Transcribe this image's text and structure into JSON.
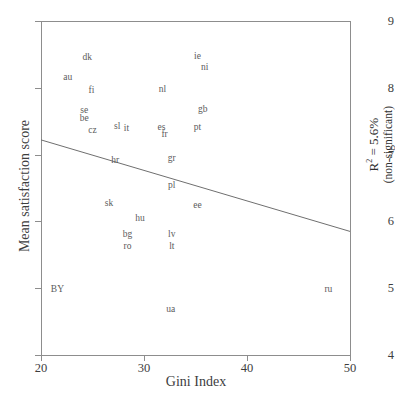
{
  "chart_data": {
    "type": "scatter",
    "title": "",
    "xlabel": "Gini Index",
    "ylabel": "Mean satisfaction score",
    "xlim": [
      20,
      50
    ],
    "ylim": [
      4,
      9
    ],
    "xticks": [
      20,
      30,
      40,
      50
    ],
    "yticks": [
      4,
      5,
      6,
      7,
      8,
      9
    ],
    "grid": false,
    "legend": null,
    "marker_style": "text-label-only",
    "points": [
      {
        "label": "dk",
        "x": 24.5,
        "y": 8.45
      },
      {
        "label": "au",
        "x": 22.6,
        "y": 8.14
      },
      {
        "label": "fi",
        "x": 24.9,
        "y": 7.95
      },
      {
        "label": "se",
        "x": 24.2,
        "y": 7.66
      },
      {
        "label": "be",
        "x": 24.2,
        "y": 7.54
      },
      {
        "label": "cz",
        "x": 25.0,
        "y": 7.35
      },
      {
        "label": "sl",
        "x": 27.4,
        "y": 7.42
      },
      {
        "label": "it",
        "x": 28.3,
        "y": 7.38
      },
      {
        "label": "nl",
        "x": 31.8,
        "y": 7.96
      },
      {
        "label": "ie",
        "x": 35.2,
        "y": 8.46
      },
      {
        "label": "ni",
        "x": 35.9,
        "y": 8.3
      },
      {
        "label": "gb",
        "x": 35.7,
        "y": 7.67
      },
      {
        "label": "pt",
        "x": 35.2,
        "y": 7.4
      },
      {
        "label": "es",
        "x": 31.7,
        "y": 7.4
      },
      {
        "label": "fr",
        "x": 32.0,
        "y": 7.29
      },
      {
        "label": "hr",
        "x": 27.2,
        "y": 6.9
      },
      {
        "label": "gr",
        "x": 32.7,
        "y": 6.93
      },
      {
        "label": "pl",
        "x": 32.7,
        "y": 6.53
      },
      {
        "label": "sk",
        "x": 26.6,
        "y": 6.26
      },
      {
        "label": "ee",
        "x": 35.2,
        "y": 6.23
      },
      {
        "label": "hu",
        "x": 29.6,
        "y": 6.04
      },
      {
        "label": "bg",
        "x": 28.4,
        "y": 5.8
      },
      {
        "label": "ro",
        "x": 28.4,
        "y": 5.62
      },
      {
        "label": "lv",
        "x": 32.7,
        "y": 5.8
      },
      {
        "label": "lt",
        "x": 32.7,
        "y": 5.62
      },
      {
        "label": "BY",
        "x": 21.6,
        "y": 4.98
      },
      {
        "label": "ua",
        "x": 32.6,
        "y": 4.68
      },
      {
        "label": "ru",
        "x": 47.9,
        "y": 4.98
      }
    ],
    "trendline": {
      "x_start": 20,
      "y_start": 7.22,
      "x_end": 50,
      "y_end": 5.85
    },
    "annotation": {
      "r2_prefix": "R",
      "r2_exponent": "2",
      "r2_value": "= 5.6%",
      "significance": "(non-significant)"
    }
  },
  "axes": {
    "x_title": "Gini Index",
    "y_title": "Mean satisfaction score",
    "x_tick_labels": [
      "20",
      "30",
      "40",
      "50"
    ],
    "y_tick_labels": [
      "9",
      "8",
      "7",
      "6",
      "5",
      "4"
    ]
  },
  "colors": {
    "axis": "#8d8d8d",
    "text": "#3d3d3d",
    "label": "#5b5b5b",
    "line": "#6f6f6f",
    "background": "#ffffff"
  }
}
